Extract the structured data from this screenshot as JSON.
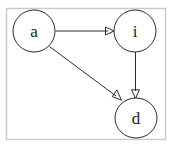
{
  "diagram": {
    "frame": {
      "name": "diagram-border",
      "color": "#c9c9c9",
      "x": 6.5,
      "y": 8.5,
      "width": 159,
      "height": 131
    },
    "style": {
      "node_fill": "#ffffff",
      "node_stroke": "#2b2b2b",
      "edge_stroke": "#2b2b2b",
      "label_color": "#1a1a1a",
      "background": "#ffffff"
    },
    "nodes": [
      {
        "id": "a",
        "label": "a",
        "cx": 34,
        "cy": 31,
        "rx": 21,
        "ry": 21
      },
      {
        "id": "i",
        "label": "i",
        "cx": 135,
        "cy": 31,
        "rx": 21,
        "ry": 21
      },
      {
        "id": "d",
        "label": "d",
        "cx": 136,
        "cy": 118,
        "rx": 21,
        "ry": 20
      }
    ],
    "edges": [
      {
        "id": "a-to-i",
        "from": "a",
        "to": "i",
        "label": "",
        "path": "M 55.5 31 L 108 31",
        "arrow": "M 114 31 L 106 27.5 L 106 34.5 Z"
      },
      {
        "id": "a-to-d",
        "from": "a",
        "to": "d",
        "label": "",
        "path": "M 49.5 46.5 L 115.5 96",
        "arrow": "M 120.5 99.8 L 113.2 95.9 L 117.4 90.3 Z"
      },
      {
        "id": "i-to-d",
        "from": "i",
        "to": "d",
        "label": "",
        "path": "M 135.5 52 L 135.5 92",
        "arrow": "M 135.5 98.5 L 132 90.5 L 139 90.5 Z"
      }
    ]
  }
}
